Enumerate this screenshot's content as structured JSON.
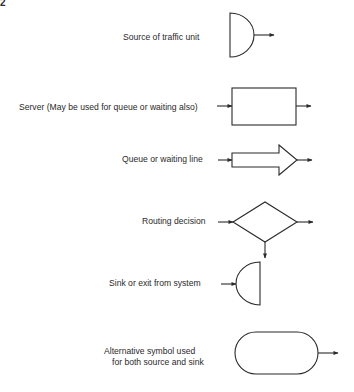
{
  "figure": {
    "number": "2",
    "type": "flowchart-symbol-legend"
  },
  "symbols": [
    {
      "shape": "half-circle-source",
      "label": "Source of traffic unit"
    },
    {
      "shape": "rectangle",
      "label": "Server (May be used for queue or waiting also)"
    },
    {
      "shape": "block-arrow",
      "label": "Queue or waiting line"
    },
    {
      "shape": "diamond",
      "label": "Routing decision"
    },
    {
      "shape": "half-circle-sink",
      "label": "Sink or exit from system"
    },
    {
      "shape": "stadium",
      "label_line1": "Alternative symbol used",
      "label_line2": "for both source and sink"
    }
  ],
  "colors": {
    "ink": "#2a2a2a",
    "background": "#ffffff"
  }
}
